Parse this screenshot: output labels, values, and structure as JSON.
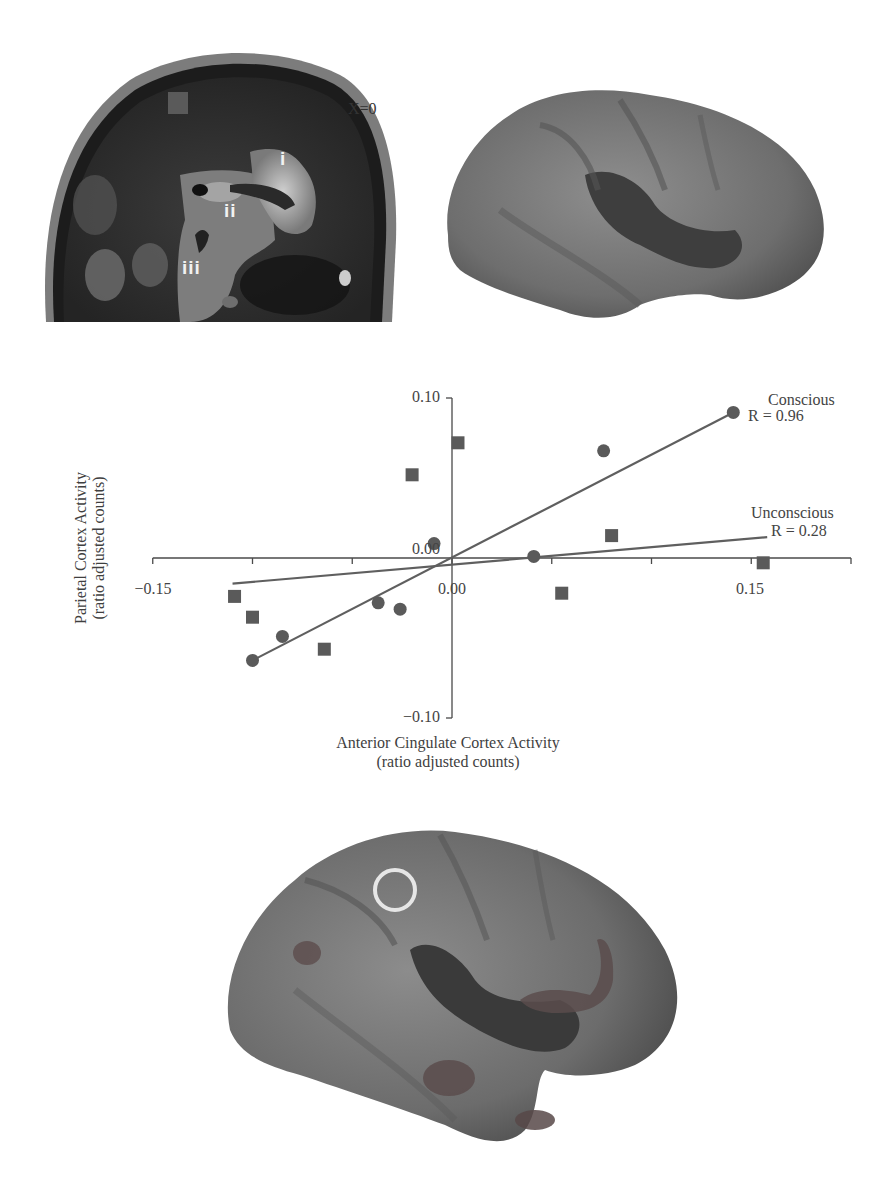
{
  "mri_panel": {
    "slice_label": "X=0",
    "region_labels": [
      "i",
      "ii",
      "iii"
    ]
  },
  "brain_top": {
    "description": "inflated cortical surface, lateral view"
  },
  "brain_bottom": {
    "description": "inflated cortical surface with activation clusters and circled parietal region",
    "marker": "circle"
  },
  "chart_data": {
    "type": "scatter",
    "title": "",
    "xlabel": "Anterior Cingulate Cortex Activity",
    "xlabel_sub": "(ratio adjusted counts)",
    "ylabel": "Parietal Cortex Activity",
    "ylabel_sub": "(ratio adjusted counts)",
    "xlim": [
      -0.15,
      0.2
    ],
    "ylim": [
      -0.1,
      0.1
    ],
    "x_tick_labels": [
      "-0.15",
      "0.00",
      "0.15"
    ],
    "x_ticks": [
      -0.15,
      -0.1,
      -0.05,
      0.0,
      0.05,
      0.1,
      0.15,
      0.2
    ],
    "y_tick_labels": [
      "0.10",
      "0.00",
      "-0.10"
    ],
    "x_tick_label_display": {
      "-0.15": "−0.15",
      "0.00": "0.00",
      "0.15": "0.15"
    },
    "y_tick_label_display": {
      "0.10": "0.10",
      "0.00": "0.00",
      "-0.10": "−0.10"
    },
    "grid": false,
    "series": [
      {
        "name": "Conscious",
        "marker": "circle",
        "annotation": "R = 0.96",
        "points": [
          {
            "x": 0.141,
            "y": 0.091
          },
          {
            "x": 0.076,
            "y": 0.067
          },
          {
            "x": 0.041,
            "y": 0.001
          },
          {
            "x": -0.009,
            "y": 0.009
          },
          {
            "x": -0.037,
            "y": -0.028
          },
          {
            "x": -0.026,
            "y": -0.032
          },
          {
            "x": -0.085,
            "y": -0.049
          },
          {
            "x": -0.1,
            "y": -0.064
          }
        ],
        "fit_line": {
          "x0": -0.1,
          "y0": -0.064,
          "x1": 0.141,
          "y1": 0.091
        }
      },
      {
        "name": "Unconscious",
        "marker": "square",
        "annotation": "R = 0.28",
        "points": [
          {
            "x": 0.003,
            "y": 0.072
          },
          {
            "x": -0.02,
            "y": 0.052
          },
          {
            "x": 0.08,
            "y": 0.014
          },
          {
            "x": 0.156,
            "y": -0.003
          },
          {
            "x": 0.055,
            "y": -0.022
          },
          {
            "x": -0.109,
            "y": -0.024
          },
          {
            "x": -0.1,
            "y": -0.037
          },
          {
            "x": -0.064,
            "y": -0.057
          }
        ],
        "fit_line": {
          "x0": -0.11,
          "y0": -0.016,
          "x1": 0.158,
          "y1": 0.013
        }
      }
    ],
    "legend": "inline annotations near line ends (upper right)",
    "colors": {
      "points": "#5a5a5a",
      "lines": "#5f5f5f",
      "axes": "#4a4a4a"
    }
  }
}
